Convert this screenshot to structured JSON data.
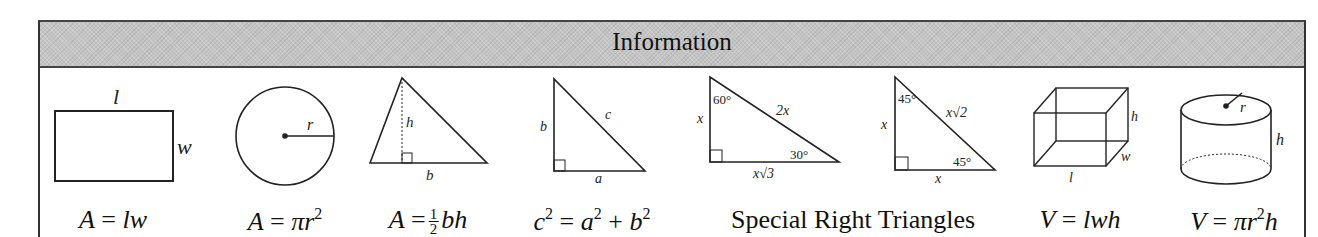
{
  "header": {
    "title": "Information"
  },
  "figures": [
    {
      "name": "rectangle",
      "labels": {
        "top": "l",
        "side": "w"
      },
      "formula": {
        "lhs": "A",
        "eq": "=",
        "rhs": "lw"
      }
    },
    {
      "name": "circle",
      "labels": {
        "radius": "r"
      },
      "formula": {
        "lhs": "A",
        "eq": "=",
        "rhs_pre": "πr",
        "exp": "2"
      }
    },
    {
      "name": "triangle",
      "labels": {
        "height": "h",
        "base": "b"
      },
      "formula": {
        "lhs": "A",
        "eq": "=",
        "frac_num": "1",
        "frac_den": "2",
        "rhs": "bh"
      }
    },
    {
      "name": "right-triangle",
      "labels": {
        "leg_b": "b",
        "hyp": "c",
        "leg_a": "a"
      },
      "formula": {
        "c": "c",
        "c_exp": "2",
        "eq": "=",
        "a": "a",
        "a_exp": "2",
        "plus": "+",
        "b": "b",
        "b_exp": "2"
      }
    },
    {
      "name": "triangle-30-60-90",
      "labels": {
        "short_leg": "x",
        "angle_top": "60°",
        "hyp": "2x",
        "angle_bottom": "30°",
        "long_leg": "x√3"
      }
    },
    {
      "name": "triangle-45-45-90",
      "labels": {
        "leg_left": "x",
        "angle_top": "45°",
        "hyp": "x√2",
        "angle_bottom": "45°",
        "leg_bottom": "x"
      }
    },
    {
      "name": "rectangular-prism",
      "labels": {
        "h": "h",
        "w": "w",
        "l": "l"
      },
      "formula": {
        "lhs": "V",
        "eq": "=",
        "rhs": "lwh"
      }
    },
    {
      "name": "cylinder",
      "labels": {
        "r": "r",
        "h": "h"
      },
      "formula": {
        "lhs": "V",
        "eq": "=",
        "rhs_pre": "πr",
        "exp": "2",
        "rhs_post": "h"
      }
    }
  ],
  "special_triangles_caption": "Special Right Triangles",
  "colors": {
    "header_bg": "#c4c4c4",
    "line": "#222222",
    "border": "#333333"
  }
}
